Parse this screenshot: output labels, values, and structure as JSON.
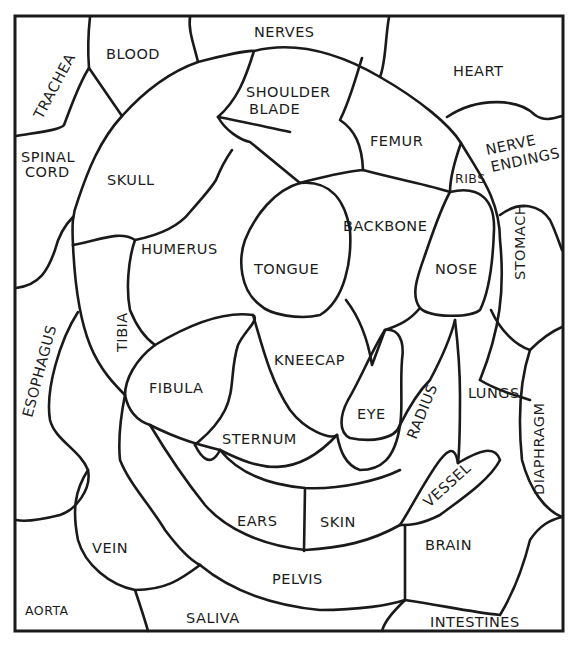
{
  "puzzle": {
    "type": "labeled region illustration",
    "frame_color": "#1a1a1a",
    "background": "#ffffff",
    "regions": [
      {
        "id": "nerves",
        "label": "NERVES"
      },
      {
        "id": "trachea",
        "label": "TRACHEA"
      },
      {
        "id": "blood",
        "label": "BLOOD"
      },
      {
        "id": "heart",
        "label": "HEART"
      },
      {
        "id": "shoulder_blade",
        "label_line1": "SHOULDER",
        "label_line2": "BLADE"
      },
      {
        "id": "femur",
        "label": "FEMUR"
      },
      {
        "id": "nerve_endings",
        "label_line1": "NERVE",
        "label_line2": "ENDINGS"
      },
      {
        "id": "spinal_cord",
        "label_line1": "SPINAL",
        "label_line2": "CORD"
      },
      {
        "id": "skull",
        "label": "SKULL"
      },
      {
        "id": "ribs",
        "label": "RIBS"
      },
      {
        "id": "backbone",
        "label": "BACKBONE"
      },
      {
        "id": "humerus",
        "label": "HUMERUS"
      },
      {
        "id": "tongue",
        "label": "TONGUE"
      },
      {
        "id": "nose",
        "label": "NOSE"
      },
      {
        "id": "stomach",
        "label": "STOMACH"
      },
      {
        "id": "esophagus",
        "label": "ESOPHAGUS"
      },
      {
        "id": "tibia",
        "label": "TIBIA"
      },
      {
        "id": "kneecap",
        "label": "KNEECAP"
      },
      {
        "id": "fibula",
        "label": "FIBULA"
      },
      {
        "id": "radius",
        "label": "RADIUS"
      },
      {
        "id": "lungs",
        "label": "LUNGS"
      },
      {
        "id": "diaphragm",
        "label": "DIAPHRAGM"
      },
      {
        "id": "eye",
        "label": "EYE"
      },
      {
        "id": "sternum",
        "label": "STERNUM"
      },
      {
        "id": "vessel",
        "label": "VESSEL"
      },
      {
        "id": "ears",
        "label": "EARS"
      },
      {
        "id": "skin",
        "label": "SKIN"
      },
      {
        "id": "vein",
        "label": "VEIN"
      },
      {
        "id": "brain",
        "label": "BRAIN"
      },
      {
        "id": "pelvis",
        "label": "PELVIS"
      },
      {
        "id": "aorta",
        "label": "AORTA"
      },
      {
        "id": "saliva",
        "label": "SALIVA"
      },
      {
        "id": "intestines",
        "label": "INTESTINES"
      }
    ]
  }
}
